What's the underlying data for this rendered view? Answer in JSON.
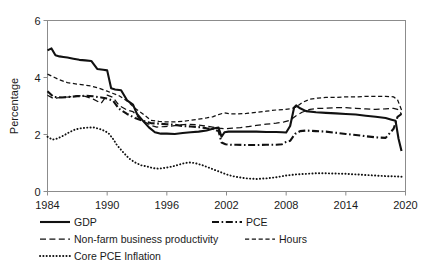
{
  "chart_data": {
    "type": "line",
    "title": "",
    "xlabel": "",
    "ylabel": "Percentage",
    "xlim": [
      1984,
      2020
    ],
    "ylim": [
      0,
      6
    ],
    "xticks": [
      1984,
      1990,
      1996,
      2002,
      2008,
      2014,
      2020
    ],
    "yticks": [
      0,
      2,
      4,
      6
    ],
    "grid": false,
    "legend_position": "below",
    "legend": [
      "GDP",
      "PCE",
      "Non-farm business productivity",
      "Hours",
      "Core PCE Inflation"
    ],
    "series": [
      {
        "name": "GDP",
        "style": "solid-thick",
        "x": [
          1984.0,
          1984.4,
          1984.8,
          1985.2,
          1985.6,
          1986.0,
          1986.6,
          1987.2,
          1987.8,
          1988.4,
          1989.0,
          1989.6,
          1990.0,
          1990.4,
          1990.8,
          1991.4,
          1992.0,
          1992.6,
          1993.0,
          1993.6,
          1994.2,
          1994.8,
          1995.4,
          1996.0,
          1996.8,
          1997.6,
          1998.4,
          1999.2,
          2000.0,
          2000.8,
          2001.2,
          2001.5,
          2001.8,
          2002.2,
          2003.0,
          2004.0,
          2005.0,
          2006.0,
          2007.0,
          2007.6,
          2008.0,
          2008.4,
          2008.8,
          2009.0,
          2009.4,
          2010.0,
          2011.0,
          2012.0,
          2013.0,
          2014.0,
          2015.0,
          2016.0,
          2017.0,
          2018.0,
          2018.6,
          2019.0,
          2019.3,
          2019.6
        ],
        "y": [
          4.95,
          5.02,
          4.78,
          4.74,
          4.72,
          4.7,
          4.66,
          4.62,
          4.6,
          4.58,
          4.3,
          4.27,
          4.25,
          3.62,
          3.58,
          3.55,
          3.2,
          3.05,
          2.72,
          2.48,
          2.25,
          2.08,
          2.03,
          2.03,
          2.02,
          2.05,
          2.08,
          2.1,
          2.14,
          2.22,
          2.24,
          1.92,
          2.08,
          2.1,
          2.1,
          2.1,
          2.1,
          2.09,
          2.09,
          2.08,
          2.07,
          2.3,
          2.95,
          3.02,
          2.92,
          2.82,
          2.78,
          2.76,
          2.74,
          2.72,
          2.7,
          2.66,
          2.62,
          2.58,
          2.52,
          2.48,
          1.85,
          1.42
        ]
      },
      {
        "name": "PCE",
        "style": "dash-dot-thick",
        "x": [
          1984.0,
          1984.6,
          1985.4,
          1986.2,
          1987.0,
          1987.8,
          1988.6,
          1989.4,
          1990.0,
          1990.6,
          1991.2,
          1992.0,
          1992.8,
          1993.6,
          1994.4,
          1995.2,
          1996.0,
          1996.8,
          1997.6,
          1998.4,
          1999.2,
          2000.0,
          2000.6,
          2001.2,
          2001.5,
          2001.9,
          2002.4,
          2003.0,
          2004.0,
          2005.0,
          2006.0,
          2007.0,
          2007.6,
          2008.0,
          2008.4,
          2008.9,
          2009.4,
          2010.0,
          2011.0,
          2012.0,
          2013.0,
          2014.0,
          2015.0,
          2016.0,
          2017.0,
          2018.0,
          2018.8,
          2019.2,
          2019.6
        ],
        "y": [
          3.52,
          3.32,
          3.3,
          3.32,
          3.34,
          3.36,
          3.34,
          3.3,
          3.26,
          3.18,
          2.9,
          2.72,
          2.58,
          2.48,
          2.4,
          2.38,
          2.36,
          2.34,
          2.3,
          2.28,
          2.26,
          2.22,
          2.2,
          2.12,
          1.72,
          1.66,
          1.64,
          1.64,
          1.63,
          1.63,
          1.64,
          1.64,
          1.66,
          1.74,
          1.78,
          2.02,
          2.12,
          2.14,
          2.12,
          2.1,
          2.06,
          2.02,
          1.98,
          1.94,
          1.9,
          1.88,
          2.2,
          2.62,
          2.72
        ]
      },
      {
        "name": "Non-farm business productivity",
        "style": "dash-long-thin",
        "x": [
          1984.0,
          1984.6,
          1985.4,
          1986.2,
          1987.0,
          1987.8,
          1988.6,
          1989.4,
          1990.0,
          1990.6,
          1991.2,
          1992.0,
          1992.6,
          1993.2,
          1993.8,
          1994.4,
          1995.0,
          1995.8,
          1996.6,
          1997.4,
          1998.2,
          1999.0,
          1999.8,
          2000.6,
          2001.2,
          2001.8,
          2002.6,
          2003.4,
          2004.2,
          2005.0,
          2006.0,
          2007.0,
          2007.8,
          2008.4,
          2009.0,
          2009.6,
          2010.4,
          2011.2,
          2012.0,
          2013.0,
          2014.0,
          2015.0,
          2016.0,
          2017.0,
          2018.0,
          2018.8,
          2019.2,
          2019.6
        ],
        "y": [
          3.38,
          3.26,
          3.3,
          3.32,
          3.36,
          3.34,
          3.24,
          3.1,
          3.38,
          3.3,
          3.02,
          2.86,
          2.8,
          2.58,
          2.44,
          2.32,
          2.26,
          2.28,
          2.3,
          2.34,
          2.36,
          2.34,
          2.3,
          2.26,
          2.22,
          2.2,
          2.22,
          2.24,
          2.28,
          2.32,
          2.36,
          2.4,
          2.44,
          2.5,
          2.66,
          2.78,
          2.88,
          2.92,
          2.92,
          2.94,
          2.94,
          2.92,
          2.9,
          2.88,
          2.9,
          2.92,
          2.88,
          2.72
        ]
      },
      {
        "name": "Hours",
        "style": "dash-short-thin",
        "x": [
          1984.0,
          1984.6,
          1985.2,
          1986.0,
          1986.8,
          1987.6,
          1988.4,
          1989.2,
          1990.0,
          1990.6,
          1991.2,
          1992.0,
          1992.8,
          1993.6,
          1994.4,
          1995.2,
          1996.0,
          1996.8,
          1997.6,
          1998.4,
          1999.2,
          2000.0,
          2000.6,
          2001.2,
          2001.8,
          2002.4,
          2003.2,
          2004.0,
          2005.0,
          2006.0,
          2007.0,
          2007.8,
          2008.4,
          2009.0,
          2009.6,
          2010.4,
          2011.2,
          2012.0,
          2013.0,
          2014.0,
          2015.0,
          2016.0,
          2017.0,
          2018.0,
          2018.8,
          2019.2,
          2019.6
        ],
        "y": [
          4.12,
          4.02,
          3.92,
          3.82,
          3.78,
          3.74,
          3.7,
          3.62,
          3.52,
          3.44,
          3.36,
          3.18,
          2.92,
          2.72,
          2.5,
          2.46,
          2.44,
          2.44,
          2.46,
          2.5,
          2.54,
          2.58,
          2.62,
          2.7,
          2.76,
          2.72,
          2.72,
          2.74,
          2.78,
          2.82,
          2.86,
          2.88,
          2.9,
          2.96,
          3.12,
          3.24,
          3.28,
          3.3,
          3.3,
          3.32,
          3.32,
          3.34,
          3.34,
          3.34,
          3.32,
          3.22,
          2.86
        ]
      },
      {
        "name": "Core PCE Inflation",
        "style": "dotted",
        "x": [
          1984.0,
          1984.5,
          1985.0,
          1985.6,
          1986.2,
          1986.8,
          1987.4,
          1988.0,
          1988.6,
          1989.2,
          1989.8,
          1990.2,
          1990.6,
          1991.0,
          1991.6,
          1992.2,
          1992.8,
          1993.4,
          1994.0,
          1994.6,
          1995.2,
          1996.0,
          1996.6,
          1997.2,
          1997.8,
          1998.4,
          1999.0,
          1999.6,
          2000.2,
          2000.8,
          2001.4,
          2002.0,
          2002.6,
          2003.2,
          2004.0,
          2005.0,
          2006.0,
          2007.0,
          2008.0,
          2009.0,
          2010.0,
          2011.0,
          2012.0,
          2013.0,
          2014.0,
          2015.0,
          2016.0,
          2017.0,
          2018.0,
          2019.0,
          2019.6
        ],
        "y": [
          1.92,
          1.82,
          1.86,
          1.96,
          2.08,
          2.18,
          2.22,
          2.24,
          2.25,
          2.2,
          2.12,
          2.02,
          1.84,
          1.62,
          1.38,
          1.16,
          1.02,
          0.92,
          0.88,
          0.82,
          0.8,
          0.84,
          0.88,
          0.94,
          1.0,
          1.02,
          0.98,
          0.92,
          0.84,
          0.76,
          0.68,
          0.6,
          0.54,
          0.5,
          0.46,
          0.44,
          0.46,
          0.5,
          0.56,
          0.6,
          0.62,
          0.64,
          0.64,
          0.63,
          0.62,
          0.6,
          0.58,
          0.56,
          0.54,
          0.53,
          0.52
        ]
      }
    ]
  },
  "axes": {
    "ylabel": "Percentage",
    "ytick_labels": [
      "0",
      "2",
      "4",
      "6"
    ],
    "xtick_labels": [
      "1984",
      "1990",
      "1996",
      "2002",
      "2008",
      "2014",
      "2020"
    ]
  },
  "legend": {
    "items": [
      {
        "label": "GDP",
        "style": "solid-thick"
      },
      {
        "label": "PCE",
        "style": "dash-dot-thick"
      },
      {
        "label": "Non-farm business productivity",
        "style": "dash-long-thin"
      },
      {
        "label": "Hours",
        "style": "dash-short-thin"
      },
      {
        "label": "Core PCE Inflation",
        "style": "dotted"
      }
    ]
  },
  "colors": {
    "series": "#111111",
    "frame": "#8c8c8c",
    "text": "#1a1a1a",
    "background": "#ffffff"
  }
}
